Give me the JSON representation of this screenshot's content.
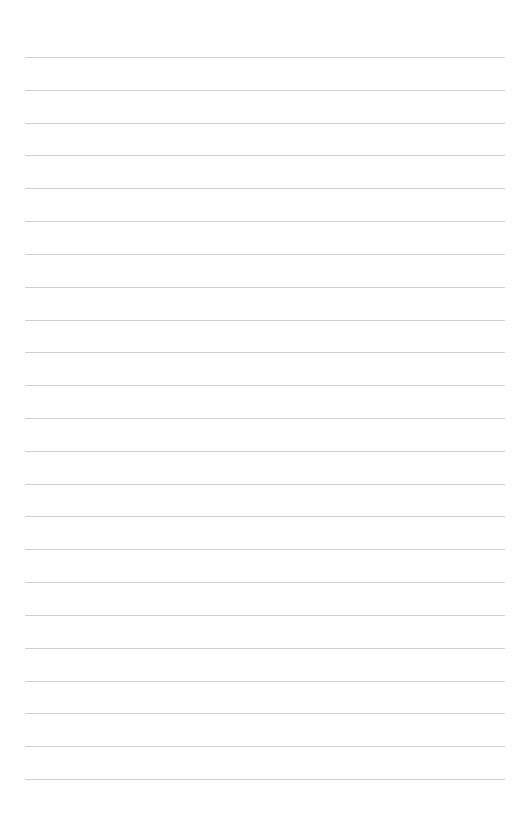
{
  "page": {
    "type": "blank lined paper",
    "line_count": 23,
    "first_line_y": 57,
    "line_spacing": 32.82,
    "line_left": 25,
    "line_width": 480,
    "line_color": "#cfcfcf",
    "background": "#ffffff"
  }
}
